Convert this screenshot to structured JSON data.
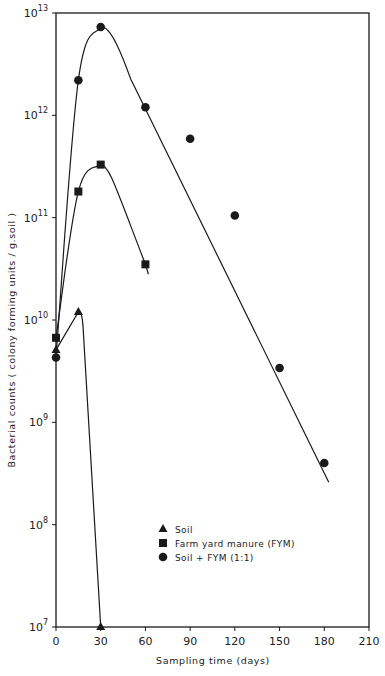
{
  "chart_data": {
    "type": "line",
    "title": "",
    "xlabel": "Sampling  time   (days)",
    "ylabel": "Bacterial  counts  ( colony  forming  units / g.soil )",
    "yscale": "log",
    "xlim": [
      0,
      210
    ],
    "ylim": [
      10000000.0,
      10000000000000.0
    ],
    "grid": false,
    "legend_position": "lower center inside",
    "x_ticks": [
      0,
      30,
      60,
      90,
      120,
      150,
      180,
      210
    ],
    "y_ticks": [
      {
        "value": 10000000.0,
        "base": "10",
        "exp": "7"
      },
      {
        "value": 100000000.0,
        "base": "10",
        "exp": "8"
      },
      {
        "value": 1000000000.0,
        "base": "10",
        "exp": "9"
      },
      {
        "value": 10000000000.0,
        "base": "10",
        "exp": "10"
      },
      {
        "value": 100000000000.0,
        "base": "10",
        "exp": "11"
      },
      {
        "value": 1000000000000.0,
        "base": "10",
        "exp": "12"
      },
      {
        "value": 10000000000000.0,
        "base": "10",
        "exp": "13"
      }
    ],
    "series": [
      {
        "name": "Soil",
        "marker": "triangle",
        "x": [
          0,
          15,
          30
        ],
        "values": [
          5100000000.0,
          12000000000.0,
          10000000.0
        ]
      },
      {
        "name": "Farm yard manure (FYM)",
        "marker": "square",
        "x": [
          0,
          15,
          30,
          60
        ],
        "values": [
          6700000000.0,
          180000000000.0,
          330000000000.0,
          35000000000.0
        ]
      },
      {
        "name": "Soil + FYM (1:1)",
        "marker": "circle",
        "x": [
          0,
          15,
          30,
          60,
          90,
          120,
          150,
          180
        ],
        "values": [
          4300000000.0,
          2200000000000.0,
          7300000000000.0,
          1200000000000.0,
          590000000000.0,
          105000000000.0,
          3400000000.0,
          400000000.0
        ]
      }
    ]
  },
  "legend": {
    "items": [
      {
        "label": "Soil",
        "marker": "triangle"
      },
      {
        "label": "Farm yard manure (FYM)",
        "marker": "square"
      },
      {
        "label": "Soil + FYM (1:1)",
        "marker": "circle"
      }
    ]
  },
  "colors": {
    "ink": "#1a1a1a",
    "background": "#ffffff"
  }
}
